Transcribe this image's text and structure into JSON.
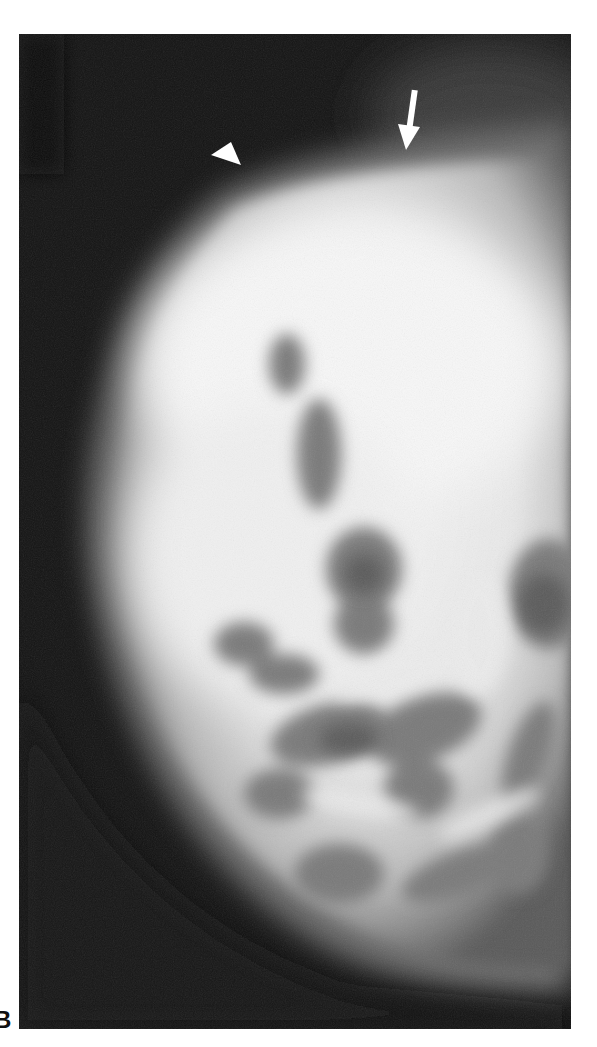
{
  "figure": {
    "panel_label": "B",
    "colors": {
      "background": "#121212",
      "tissue_bright": "#f4f4f4",
      "tissue_mid": "#a8a8a8",
      "lucent_area": "#6a6a6a",
      "page": "#ffffff",
      "annotation": "#ffffff"
    },
    "annotations": [
      {
        "type": "arrowhead",
        "label": "arrowhead-marker",
        "direction": "down-right"
      },
      {
        "type": "arrow",
        "label": "arrow-marker",
        "direction": "down"
      }
    ]
  }
}
